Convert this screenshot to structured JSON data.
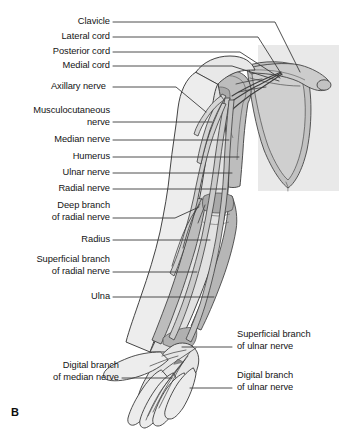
{
  "figure": {
    "panel_letter": "B",
    "background_panel_color": "#e9e9e9",
    "limb_fill_color": "#ececec",
    "bone_fill_color": "#b9b9b9",
    "nerve_fill_color": "#c9c9c9",
    "outline_color": "#3a3a3a",
    "leader_line_color": "#3b3b3b"
  },
  "labels_left": [
    {
      "text": "Clavicle",
      "lines": [
        "Clavicle"
      ]
    },
    {
      "text": "Lateral cord",
      "lines": [
        "Lateral cord"
      ]
    },
    {
      "text": "Posterior cord",
      "lines": [
        "Posterior cord"
      ]
    },
    {
      "text": "Medial cord",
      "lines": [
        "Medial cord"
      ]
    },
    {
      "text": "Axillary nerve",
      "lines": [
        "Axillary nerve"
      ]
    },
    {
      "text": "Musculocutaneous nerve",
      "lines": [
        "Musculocutaneous",
        "nerve"
      ]
    },
    {
      "text": "Median nerve",
      "lines": [
        "Median nerve"
      ]
    },
    {
      "text": "Humerus",
      "lines": [
        "Humerus"
      ]
    },
    {
      "text": "Ulnar nerve",
      "lines": [
        "Ulnar nerve"
      ]
    },
    {
      "text": "Radial nerve",
      "lines": [
        "Radial nerve"
      ]
    },
    {
      "text": "Deep branch of radial nerve",
      "lines": [
        "Deep branch",
        "of radial nerve"
      ]
    },
    {
      "text": "Radius",
      "lines": [
        "Radius"
      ]
    },
    {
      "text": "Superficial branch of radial nerve",
      "lines": [
        "Superficial branch",
        "of radial nerve"
      ]
    },
    {
      "text": "Ulna",
      "lines": [
        "Ulna"
      ]
    },
    {
      "text": "Digital branch of median nerve",
      "lines": [
        "Digital branch",
        "of median nerve"
      ]
    }
  ],
  "labels_right": [
    {
      "text": "Superficial branch of ulnar nerve",
      "lines": [
        "Superficial branch",
        "of ulnar nerve"
      ]
    },
    {
      "text": "Digital branch of ulnar nerve",
      "lines": [
        "Digital branch",
        "of ulnar nerve"
      ]
    }
  ]
}
